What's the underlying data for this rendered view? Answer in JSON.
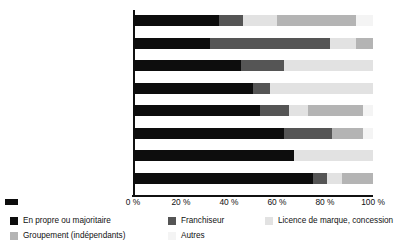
{
  "chart_data": {
    "type": "bar",
    "orientation": "horizontal",
    "stacked": true,
    "title": "",
    "xlabel": "",
    "ylabel": "",
    "xlim": [
      0,
      100
    ],
    "xticks": [
      "0 %",
      "20 %",
      "40 %",
      "60 %",
      "80 %",
      "100 %"
    ],
    "xtick_values": [
      0,
      20,
      40,
      60,
      80,
      100
    ],
    "grid": false,
    "legend_position": "bottom",
    "categories": [
      "Culture-loisirs-sport",
      "Autres commerces alimentaires",
      "Commerce et réparation\nd’automobiles",
      "Grandes surfaces alimentaires",
      "Equipements du foyer",
      "Autres commerces\nnon alimentaires",
      "Aménagement de l’habitat",
      "Equipements de la personne"
    ],
    "series": [
      {
        "name": "En propre ou majoritaire",
        "color": "#0d0d0d",
        "values": [
          36,
          32,
          45,
          50,
          53,
          63,
          67,
          75
        ]
      },
      {
        "name": "Franchiseur",
        "color": "#555555",
        "values": [
          10,
          50,
          18,
          7,
          12,
          20,
          0,
          6
        ]
      },
      {
        "name": "Licence de marque, concession",
        "color": "#e2e2e2",
        "values": [
          14,
          11,
          37,
          43,
          8,
          0,
          33,
          6
        ]
      },
      {
        "name": "Groupement (indépendants)",
        "color": "#b4b4b4",
        "values": [
          33,
          7,
          0,
          0,
          23,
          13,
          0,
          13
        ]
      },
      {
        "name": "Autres",
        "color": "#f4f4f4",
        "values": [
          7,
          0,
          0,
          0,
          4,
          4,
          0,
          0
        ]
      }
    ]
  },
  "legend": {
    "items": [
      {
        "label": "En propre ou majoritaire",
        "swatch": "s0",
        "col": 0,
        "row": 0
      },
      {
        "label": "Franchiseur",
        "swatch": "s1",
        "col": 1,
        "row": 0
      },
      {
        "label": "Licence de marque, concession",
        "swatch": "s2",
        "col": 2,
        "row": 0
      },
      {
        "label": "Groupement (indépendants)",
        "swatch": "s3",
        "col": 0,
        "row": 1
      },
      {
        "label": "Autres",
        "swatch": "s4",
        "col": 1,
        "row": 1
      }
    ]
  }
}
